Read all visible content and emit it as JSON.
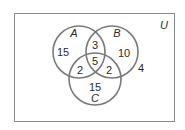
{
  "diagram": {
    "type": "venn-3-set",
    "universe_label": "U",
    "colors": {
      "circle_stroke": "#7a7a7a",
      "universe_stroke": "#8a8a8a",
      "text": "#2a2a2a",
      "background": "#ffffff"
    },
    "sets": [
      {
        "name": "A",
        "label": "A"
      },
      {
        "name": "B",
        "label": "B"
      },
      {
        "name": "C",
        "label": "C"
      }
    ],
    "regions": {
      "A_only": "15",
      "B_only": "10",
      "C_only": "15",
      "A_and_B_only": "3",
      "A_and_C_only": "2",
      "B_and_C_only": "2",
      "A_and_B_and_C": "5",
      "outside": "4"
    }
  }
}
